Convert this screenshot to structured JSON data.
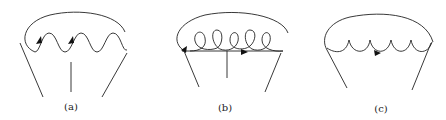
{
  "figure": {
    "panels": [
      {
        "id": "a",
        "label": "(a)",
        "description": "Self-energy-like diagram with wavy (photon) line and arrowed fermion arc, three external legs"
      },
      {
        "id": "b",
        "label": "(b)",
        "description": "Diagram with curly (gluon) line on fermion line with arrows, outer arc, three external legs"
      },
      {
        "id": "c",
        "label": "(c)",
        "description": "Diagram with scalloped (ghost/gluon) line and arrow, outer arc, two external legs"
      }
    ],
    "line_color": "#222222",
    "background": "#ffffff"
  }
}
